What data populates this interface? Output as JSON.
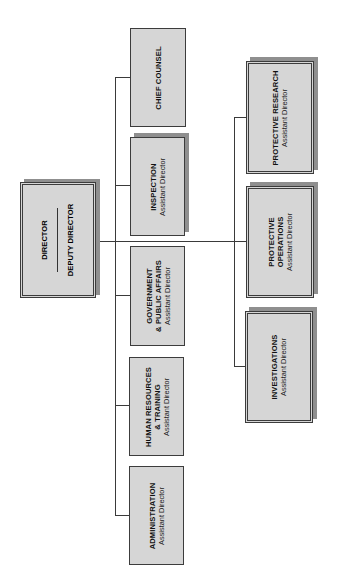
{
  "chart": {
    "orientation": "rotated-90-ccw",
    "colors": {
      "box_fill": "#d6d6d6",
      "box_border": "#3c3c3c",
      "shadow": "#8f8f8f",
      "connector": "#3a3a3a",
      "background": "#ffffff"
    },
    "top": {
      "title": "DIRECTOR",
      "deputy": "DEPUTY DIRECTOR"
    },
    "staff_units": [
      {
        "id": "chief-counsel",
        "title": "CHIEF COUNSEL",
        "subtitle": ""
      },
      {
        "id": "inspection",
        "title": "INSPECTION",
        "subtitle": "Assistant Director"
      },
      {
        "id": "government-public-affairs",
        "title_line1": "GOVERNMENT",
        "title_line2": "& PUBLIC AFFAIRS",
        "subtitle": "Assistant Director"
      },
      {
        "id": "human-resources-training",
        "title_line1": "HUMAN RESOURCES",
        "title_line2": "& TRAINING",
        "subtitle": "Assistant Director"
      },
      {
        "id": "administration",
        "title": "ADMINISTRATION",
        "subtitle": "Assistant Director"
      }
    ],
    "operational_units": [
      {
        "id": "protective-research",
        "title": "PROTECTIVE RESEARCH",
        "subtitle": "Assistant Director"
      },
      {
        "id": "protective-operations",
        "title_line1": "PROTECTIVE",
        "title_line2": "OPERATIONS",
        "subtitle": "Assistant Director"
      },
      {
        "id": "investigations",
        "title": "INVESTIGATIONS",
        "subtitle": "Assistant Director"
      }
    ]
  }
}
